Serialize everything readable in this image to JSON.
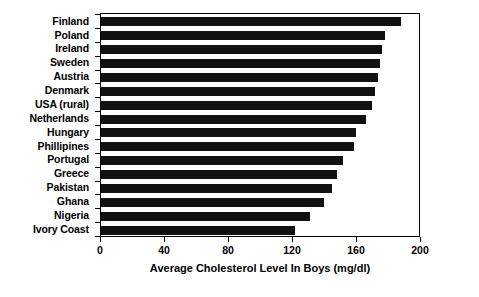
{
  "chart_data": {
    "type": "bar",
    "orientation": "horizontal",
    "title": "",
    "xlabel": "Average Cholesterol Level In Boys (mg/dl)",
    "ylabel": "",
    "xlim": [
      0,
      200
    ],
    "xticks": [
      0,
      40,
      80,
      120,
      160,
      200
    ],
    "xtick_labels": [
      "0",
      "40",
      "80",
      "120",
      "160",
      "200"
    ],
    "grid": false,
    "legend": null,
    "bar_color": "#111111",
    "categories": [
      "Finland",
      "Poland",
      "Ireland",
      "Sweden",
      "Austria",
      "Denmark",
      "USA (rural)",
      "Netherlands",
      "Hungary",
      "Phillipines",
      "Portugal",
      "Greece",
      "Pakistan",
      "Ghana",
      "Nigeria",
      "Ivory Coast"
    ],
    "values": [
      188,
      178,
      176,
      175,
      174,
      172,
      170,
      166,
      160,
      159,
      152,
      148,
      145,
      140,
      131,
      122
    ]
  }
}
